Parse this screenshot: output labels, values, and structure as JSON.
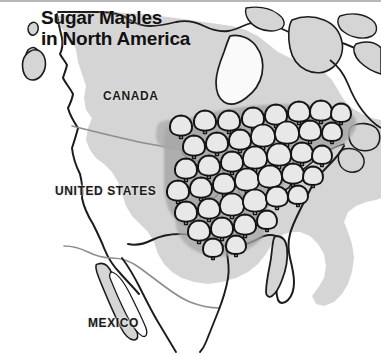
{
  "figure": {
    "kind": "thematic-range-map",
    "title": "Sugar Maples\nin North America",
    "title_line_1": "Sugar Maples",
    "title_line_2": "in North America",
    "background_color": "#ffffff",
    "land_color": "#d4d4d4",
    "range_shade_color": "#a9a9a9",
    "outline_color": "#1a1a1a",
    "internal_border_color": "#8c8c8c",
    "tree_fill_color": "#e8e8e8",
    "tree_outline_color": "#141414",
    "top_rule_color": "#b8b8b8"
  },
  "labels": {
    "canada": "CANADA",
    "united_states": "UNITED STATES",
    "mexico": "MEXICO"
  },
  "chart_data": {
    "type": "map",
    "title": "Sugar Maples in North America",
    "subtitle": "",
    "legend": [],
    "annotations": [
      "CANADA",
      "UNITED STATES",
      "MEXICO"
    ],
    "symbol": "tree",
    "symbol_meaning": "sugar maple range",
    "tree_count": 41,
    "trees": [
      {
        "x": 181,
        "y": 127,
        "r": 11
      },
      {
        "x": 205,
        "y": 122,
        "r": 11
      },
      {
        "x": 229,
        "y": 122,
        "r": 11
      },
      {
        "x": 253,
        "y": 119,
        "r": 11
      },
      {
        "x": 276,
        "y": 116,
        "r": 11
      },
      {
        "x": 299,
        "y": 113,
        "r": 11
      },
      {
        "x": 321,
        "y": 112,
        "r": 11
      },
      {
        "x": 341,
        "y": 114,
        "r": 10
      },
      {
        "x": 194,
        "y": 147,
        "r": 11
      },
      {
        "x": 217,
        "y": 144,
        "r": 11
      },
      {
        "x": 240,
        "y": 141,
        "r": 11
      },
      {
        "x": 263,
        "y": 137,
        "r": 12
      },
      {
        "x": 287,
        "y": 134,
        "r": 12
      },
      {
        "x": 310,
        "y": 132,
        "r": 11
      },
      {
        "x": 332,
        "y": 133,
        "r": 10
      },
      {
        "x": 186,
        "y": 170,
        "r": 11
      },
      {
        "x": 209,
        "y": 167,
        "r": 11
      },
      {
        "x": 232,
        "y": 163,
        "r": 11
      },
      {
        "x": 255,
        "y": 159,
        "r": 12
      },
      {
        "x": 279,
        "y": 156,
        "r": 12
      },
      {
        "x": 302,
        "y": 154,
        "r": 11
      },
      {
        "x": 322,
        "y": 156,
        "r": 10
      },
      {
        "x": 178,
        "y": 192,
        "r": 11
      },
      {
        "x": 201,
        "y": 189,
        "r": 11
      },
      {
        "x": 224,
        "y": 185,
        "r": 11
      },
      {
        "x": 247,
        "y": 181,
        "r": 12
      },
      {
        "x": 270,
        "y": 178,
        "r": 12
      },
      {
        "x": 293,
        "y": 175,
        "r": 11
      },
      {
        "x": 313,
        "y": 177,
        "r": 10
      },
      {
        "x": 186,
        "y": 213,
        "r": 11
      },
      {
        "x": 209,
        "y": 210,
        "r": 11
      },
      {
        "x": 232,
        "y": 206,
        "r": 12
      },
      {
        "x": 255,
        "y": 202,
        "r": 12
      },
      {
        "x": 277,
        "y": 198,
        "r": 11
      },
      {
        "x": 298,
        "y": 196,
        "r": 10
      },
      {
        "x": 199,
        "y": 232,
        "r": 11
      },
      {
        "x": 222,
        "y": 229,
        "r": 11
      },
      {
        "x": 245,
        "y": 226,
        "r": 11
      },
      {
        "x": 267,
        "y": 221,
        "r": 10
      },
      {
        "x": 213,
        "y": 249,
        "r": 10
      },
      {
        "x": 236,
        "y": 246,
        "r": 10
      }
    ]
  }
}
